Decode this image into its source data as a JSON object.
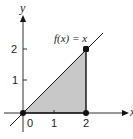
{
  "diagram": {
    "function_label": "f(x) = x",
    "x_axis_label": "x",
    "y_axis_label": "y",
    "x_ticks": [
      "0",
      "1",
      "2"
    ],
    "y_ticks": [
      "1",
      "2"
    ],
    "points": [
      {
        "x": 0,
        "y": 0
      },
      {
        "x": 2,
        "y": 0
      },
      {
        "x": 2,
        "y": 2
      }
    ],
    "shaded_region": "triangle under f(x)=x from x=0 to x=2",
    "colors": {
      "line": "#1a1a1a",
      "shade": "#c8c8c8",
      "background": "#ffffff"
    }
  }
}
